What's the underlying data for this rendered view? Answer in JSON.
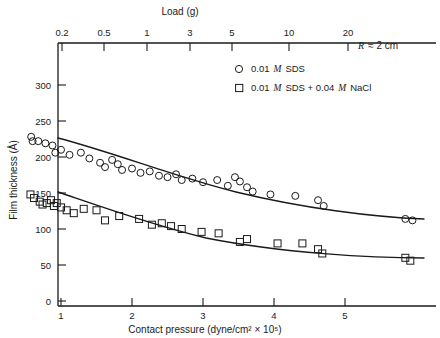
{
  "chart_data": {
    "type": "scatter",
    "title": "",
    "xlabel": "Contact pressure (dyne/cm² × 10⁵)",
    "ylabel": "Film thickness (Å)",
    "top_axis_label": "Load (g)",
    "top_axis_ticks": [
      "0.2",
      "0.5",
      "1",
      "3",
      "5",
      "10",
      "20"
    ],
    "top_axis_tick_x": [
      62,
      104,
      147,
      190,
      232,
      289,
      348
    ],
    "bottom_axis_ticks": [
      "1",
      "2",
      "3",
      "4",
      "5"
    ],
    "bottom_axis_tick_x": [
      61,
      132,
      203,
      274,
      345
    ],
    "y_ticks": [
      "0",
      "50",
      "100",
      "150",
      "200",
      "250",
      "300"
    ],
    "ylim": [
      0,
      320
    ],
    "xlim_pressure": [
      0.55,
      6.1
    ],
    "grid": false,
    "annotation": "R ≈ 2 cm",
    "annotation_symbol": "R",
    "annotation_rest": "≈ 2 cm",
    "legend_position": "top-right",
    "series": [
      {
        "name": "0.01 M SDS",
        "marker": "circle",
        "legend_prefix": "0.01",
        "legend_molar": "M",
        "legend_suffix": "SDS",
        "points": [
          [
            0.58,
            228
          ],
          [
            0.6,
            222
          ],
          [
            0.68,
            222
          ],
          [
            0.78,
            219
          ],
          [
            0.88,
            216
          ],
          [
            0.92,
            206
          ],
          [
            1.0,
            210
          ],
          [
            1.12,
            203
          ],
          [
            1.28,
            206
          ],
          [
            1.4,
            198
          ],
          [
            1.55,
            192
          ],
          [
            1.62,
            186
          ],
          [
            1.72,
            196
          ],
          [
            1.8,
            190
          ],
          [
            1.86,
            182
          ],
          [
            2.0,
            184
          ],
          [
            2.12,
            178
          ],
          [
            2.25,
            180
          ],
          [
            2.38,
            174
          ],
          [
            2.5,
            172
          ],
          [
            2.62,
            176
          ],
          [
            2.7,
            168
          ],
          [
            2.85,
            170
          ],
          [
            3.0,
            165
          ],
          [
            3.2,
            168
          ],
          [
            3.35,
            160
          ],
          [
            3.45,
            172
          ],
          [
            3.52,
            166
          ],
          [
            3.62,
            158
          ],
          [
            3.7,
            152
          ],
          [
            3.95,
            148
          ],
          [
            4.3,
            146
          ],
          [
            4.62,
            140
          ],
          [
            4.7,
            132
          ],
          [
            5.85,
            114
          ],
          [
            5.95,
            112
          ]
        ]
      },
      {
        "name": "0.01 M SDS + 0.04 M NaCl",
        "marker": "square",
        "legend_prefix": "0.01",
        "legend_molar": "M",
        "legend_suffix": "SDS + 0.04",
        "legend_molar2": "M",
        "legend_suffix2": "NaCl",
        "points": [
          [
            0.57,
            148
          ],
          [
            0.62,
            143
          ],
          [
            0.7,
            138
          ],
          [
            0.74,
            134
          ],
          [
            0.8,
            136
          ],
          [
            0.86,
            140
          ],
          [
            0.9,
            132
          ],
          [
            0.94,
            136
          ],
          [
            1.0,
            130
          ],
          [
            1.08,
            126
          ],
          [
            1.18,
            122
          ],
          [
            1.32,
            128
          ],
          [
            1.5,
            126
          ],
          [
            1.62,
            112
          ],
          [
            1.82,
            118
          ],
          [
            2.1,
            114
          ],
          [
            2.28,
            106
          ],
          [
            2.42,
            108
          ],
          [
            2.55,
            104
          ],
          [
            2.7,
            100
          ],
          [
            2.98,
            96
          ],
          [
            3.22,
            94
          ],
          [
            3.52,
            82
          ],
          [
            3.62,
            86
          ],
          [
            4.05,
            80
          ],
          [
            4.4,
            80
          ],
          [
            4.62,
            72
          ],
          [
            4.68,
            66
          ],
          [
            5.85,
            60
          ],
          [
            5.92,
            56
          ]
        ]
      }
    ],
    "fit_curves": [
      {
        "name": "0.01 M SDS fit",
        "path": "M 58,138 C 110,152 175,176 235,192 C 300,208 370,217 422,219"
      },
      {
        "name": "0.01 M SDS + 0.04 M NaCl fit",
        "path": "M 58,192 C 100,206 150,224 205,238 C 280,253 370,258 422,258"
      }
    ]
  },
  "colors": {
    "ink": "#1a1a1a",
    "background": "#ffffff"
  }
}
